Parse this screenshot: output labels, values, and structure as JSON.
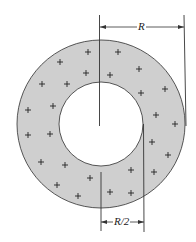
{
  "figure": {
    "type": "annulus-charge-distribution",
    "colors": {
      "ring_fill": "#cfcfcf",
      "stroke": "#333333",
      "background": "#ffffff"
    },
    "ring": {
      "cx": 101,
      "cy": 124,
      "outer_r": 84,
      "inner_r": 42
    },
    "charge_symbol": "+",
    "charges": [
      [
        88,
        52
      ],
      [
        118,
        52
      ],
      [
        60,
        62
      ],
      [
        86,
        73
      ],
      [
        110,
        75
      ],
      [
        139,
        69
      ],
      [
        42,
        84
      ],
      [
        67,
        84
      ],
      [
        141,
        93
      ],
      [
        165,
        89
      ],
      [
        28,
        110
      ],
      [
        53,
        106
      ],
      [
        156,
        115
      ],
      [
        28,
        135
      ],
      [
        50,
        134
      ],
      [
        175,
        124
      ],
      [
        152,
        142
      ],
      [
        168,
        155
      ],
      [
        41,
        162
      ],
      [
        65,
        165
      ],
      [
        131,
        170
      ],
      [
        154,
        172
      ],
      [
        90,
        178
      ],
      [
        57,
        185
      ],
      [
        78,
        196
      ],
      [
        110,
        192
      ],
      [
        131,
        193
      ]
    ],
    "labels": {
      "outer_radius": "R",
      "inner_radius": "R/2"
    }
  }
}
